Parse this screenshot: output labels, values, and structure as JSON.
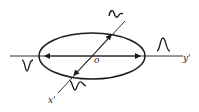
{
  "diagram": {
    "labels": {
      "origin": "o",
      "horizontal_axis": "y'",
      "diagonal_axis": "x'"
    },
    "colors": {
      "stroke": "#1a1a1a",
      "background": "#ffffff"
    },
    "pulses": [
      {
        "name": "top-right",
        "shape": "sinusoidal-wiggle"
      },
      {
        "name": "right",
        "shape": "single-peak"
      },
      {
        "name": "left",
        "shape": "single-trough"
      },
      {
        "name": "bottom-left",
        "shape": "trough-then-peak"
      }
    ]
  }
}
